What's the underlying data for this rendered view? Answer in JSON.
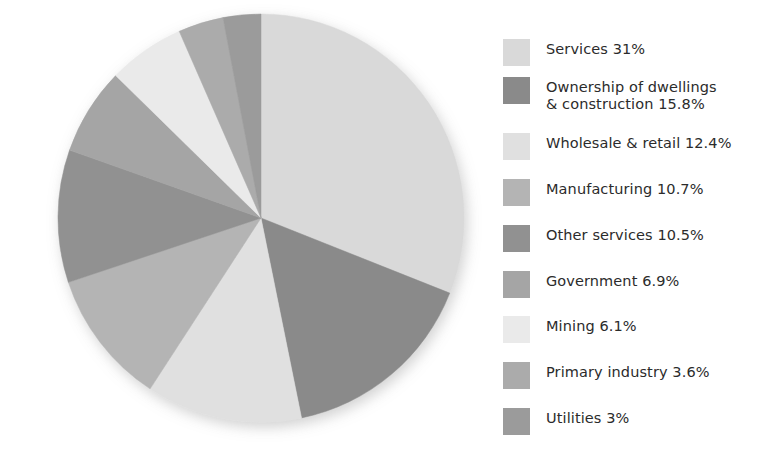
{
  "figure": {
    "background": "#ffffff",
    "text_color": "#2b2b2b"
  },
  "chart_data": {
    "type": "pie",
    "title": "",
    "subtitle": "",
    "xlabel": "",
    "ylabel": "",
    "grid": false,
    "legend_position": "right",
    "start_angle_deg": 0,
    "direction": "clockwise",
    "units": "percent",
    "total": 100,
    "categories": [
      "Services",
      "Ownership of dwellings & construction",
      "Wholesale & retail",
      "Manufacturing",
      "Other services",
      "Government",
      "Mining",
      "Primary industry",
      "Utilities"
    ],
    "values": [
      31,
      15.8,
      12.4,
      10.7,
      10.5,
      6.9,
      6.1,
      3.6,
      3
    ],
    "value_labels": [
      "31%",
      "15.8%",
      "12.4%",
      "10.7%",
      "10.5%",
      "6.9%",
      "6.1%",
      "3.6%",
      "3%"
    ],
    "colors": [
      "#d9d9d9",
      "#8a8a8a",
      "#e0e0e0",
      "#b4b4b4",
      "#919191",
      "#a5a5a5",
      "#eaeaea",
      "#ababab",
      "#9b9b9b"
    ],
    "slices": [
      {
        "name": "Services",
        "value": 31,
        "label": "Services 31%",
        "color": "#d9d9d9"
      },
      {
        "name": "Ownership of dwellings & construction",
        "value": 15.8,
        "label": "Ownership of dwellings\n& construction 15.8%",
        "color": "#8a8a8a"
      },
      {
        "name": "Wholesale & retail",
        "value": 12.4,
        "label": "Wholesale & retail 12.4%",
        "color": "#e0e0e0"
      },
      {
        "name": "Manufacturing",
        "value": 10.7,
        "label": "Manufacturing 10.7%",
        "color": "#b4b4b4"
      },
      {
        "name": "Other services",
        "value": 10.5,
        "label": "Other services 10.5%",
        "color": "#919191"
      },
      {
        "name": "Government",
        "value": 6.9,
        "label": "Government 6.9%",
        "color": "#a5a5a5"
      },
      {
        "name": "Mining",
        "value": 6.1,
        "label": "Mining 6.1%",
        "color": "#eaeaea"
      },
      {
        "name": "Primary industry",
        "value": 3.6,
        "label": "Primary industry 3.6%",
        "color": "#ababab"
      },
      {
        "name": "Utilities",
        "value": 3,
        "label": "Utilities 3%",
        "color": "#9b9b9b"
      }
    ]
  },
  "legend": {
    "items": [
      {
        "label": "Services 31%",
        "color": "#d9d9d9",
        "top": 18,
        "name": "services"
      },
      {
        "label": "Ownership of dwellings\n& construction 15.8%",
        "color": "#8a8a8a",
        "top": 56,
        "name": "ownership-of-dwellings-construction"
      },
      {
        "label": "Wholesale & retail 12.4%",
        "color": "#e0e0e0",
        "top": 112,
        "name": "wholesale-retail"
      },
      {
        "label": "Manufacturing 10.7%",
        "color": "#b4b4b4",
        "top": 158,
        "name": "manufacturing"
      },
      {
        "label": "Other services 10.5%",
        "color": "#919191",
        "top": 204,
        "name": "other-services"
      },
      {
        "label": "Government 6.9%",
        "color": "#a5a5a5",
        "top": 250,
        "name": "government"
      },
      {
        "label": "Mining 6.1%",
        "color": "#eaeaea",
        "top": 295,
        "name": "mining"
      },
      {
        "label": "Primary industry 3.6%",
        "color": "#ababab",
        "top": 341,
        "name": "primary-industry"
      },
      {
        "label": "Utilities 3%",
        "color": "#9b9b9b",
        "top": 387,
        "name": "utilities"
      }
    ]
  }
}
